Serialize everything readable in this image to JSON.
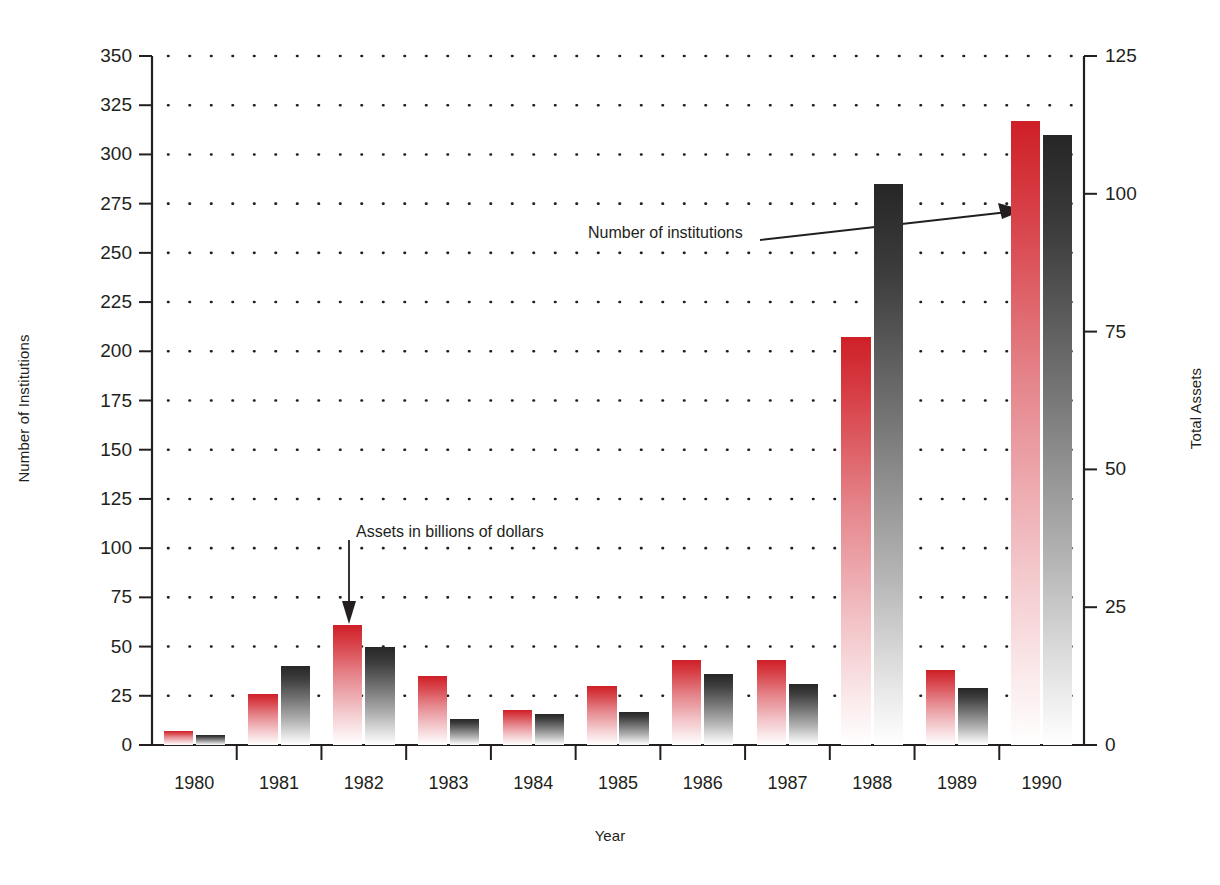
{
  "chart_data": {
    "type": "bar",
    "title": "",
    "xlabel": "Year",
    "ylabel": "Number of Institutions",
    "y2label": "Total Assets",
    "categories": [
      "1980",
      "1981",
      "1982",
      "1983",
      "1984",
      "1985",
      "1986",
      "1987",
      "1988",
      "1989",
      "1990"
    ],
    "ylim": [
      0,
      350
    ],
    "y2lim": [
      0,
      125
    ],
    "yticks": [
      "0",
      "25",
      "50",
      "75",
      "100",
      "125",
      "150",
      "175",
      "200",
      "225",
      "250",
      "275",
      "300",
      "325",
      "350"
    ],
    "y2ticks": [
      "0",
      "25",
      "50",
      "75",
      "100",
      "125"
    ],
    "grid": "horizontal-dotted",
    "legend": "annotations",
    "series": [
      {
        "name": "Assets in billions of dollars",
        "axis": "right",
        "color": "#cf1f27",
        "values": [
          2.5,
          9.3,
          21.8,
          12.5,
          6.4,
          10.7,
          15.4,
          15.4,
          74.0,
          13.6,
          113.2
        ],
        "values_left_scale": [
          7,
          26,
          61,
          35,
          18,
          30,
          43,
          43,
          207,
          38,
          317
        ]
      },
      {
        "name": "Number of institutions",
        "axis": "left",
        "color": "#262626",
        "values": [
          5,
          40,
          50,
          13,
          16,
          17,
          36,
          31,
          285,
          29,
          310
        ]
      }
    ],
    "annotations": [
      {
        "text": "Assets in billions of dollars",
        "points_to": "1982 red bar",
        "arrow": "down"
      },
      {
        "text": "Number of institutions",
        "points_to": "1988 dark bar",
        "arrow": "right"
      }
    ]
  },
  "axes": {
    "left_title": "Number of Institutions",
    "right_title": "Total Assets",
    "x_title": "Year"
  },
  "annotations": {
    "assets": "Assets in billions of dollars",
    "institutions": "Number of institutions"
  },
  "colors": {
    "assets": "#cf1f27",
    "institutions": "#262626",
    "axis": "#231f20",
    "grid": "#231f20"
  }
}
